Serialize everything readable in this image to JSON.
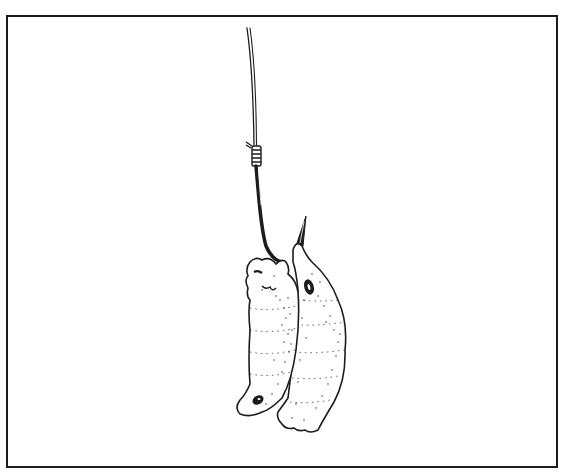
{
  "illustration": {
    "subject": "two maggots on a fishing hook",
    "style": "black ink line drawing with stipple shading",
    "colors": {
      "background": "#ffffff",
      "ink": "#1c1c1c",
      "frame": "#1c1c1c"
    },
    "elements": [
      {
        "name": "fishing-line",
        "description": "thin double line descending from top center"
      },
      {
        "name": "whipping-knot",
        "description": "wrapped knot tying line to hook shank"
      },
      {
        "name": "hook",
        "description": "dark shank curving into a barbed point"
      },
      {
        "name": "maggot-left",
        "description": "segmented maggot hooked through head, tail curling left"
      },
      {
        "name": "maggot-right",
        "description": "segmented maggot hooked behind the point, hanging right"
      }
    ]
  }
}
